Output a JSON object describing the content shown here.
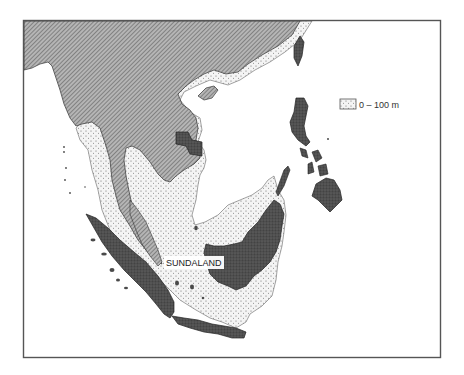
{
  "map": {
    "region_label": "SUNDALAND",
    "legend": {
      "items": [
        {
          "label": "0 – 100 m",
          "pattern": "dotted-shelf"
        }
      ]
    },
    "colors": {
      "frame": "#555555",
      "sea": "#ffffff",
      "mainland_hatch_bg": "#b8b8b8",
      "mainland_hatch_line": "#5a5a5a",
      "island_dark": "#4a4a4a",
      "shelf_bg": "#f2f2f2",
      "shelf_dot": "#555555"
    }
  }
}
